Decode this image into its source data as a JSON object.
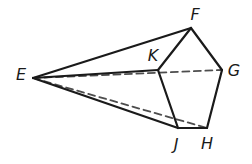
{
  "figure": {
    "background_color": "#ffffff",
    "solid_line_color": "#1a1a1a",
    "dashed_line_color": "#4d4d4d",
    "vertices": {
      "E": {
        "x": 33,
        "y": 78,
        "label": "E",
        "label_x": 21,
        "label_y": 80
      },
      "F": {
        "x": 191,
        "y": 28,
        "label": "F",
        "label_x": 195,
        "label_y": 20
      },
      "K": {
        "x": 158,
        "y": 70,
        "label": "K",
        "label_x": 153,
        "label_y": 61
      },
      "G": {
        "x": 222,
        "y": 70,
        "label": "G",
        "label_x": 234,
        "label_y": 76
      },
      "J": {
        "x": 178,
        "y": 128,
        "label": "J",
        "label_x": 176,
        "label_y": 150
      },
      "H": {
        "x": 207,
        "y": 128,
        "label": "H",
        "label_x": 207,
        "label_y": 149
      }
    },
    "solid_edges": [
      [
        "E",
        "F"
      ],
      [
        "E",
        "K"
      ],
      [
        "E",
        "J"
      ],
      [
        "F",
        "K"
      ],
      [
        "F",
        "G"
      ],
      [
        "K",
        "J"
      ],
      [
        "J",
        "H"
      ],
      [
        "H",
        "G"
      ]
    ],
    "dashed_edges": [
      [
        "E",
        "G"
      ],
      [
        "E",
        "H"
      ]
    ],
    "style": {
      "solid_width": 2.2,
      "dashed_width": 1.8,
      "dash_pattern": "7,4.5"
    }
  }
}
